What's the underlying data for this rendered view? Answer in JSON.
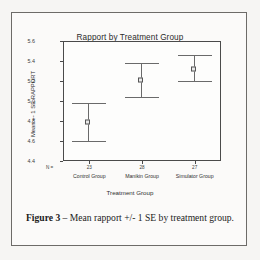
{
  "figure": {
    "caption_label": "Figure 3",
    "caption_dash": " – ",
    "caption_text": "Mean rapport +/- 1 SE by treatment group."
  },
  "chart_data": {
    "type": "scatter",
    "title": "Rapport by Treatment Group",
    "xlabel": "Treatment Group",
    "ylabel": "Mean +- 1 SE RAPPORT",
    "categories": [
      "Control Group",
      "Manikin Group",
      "Simulator Group"
    ],
    "values": [
      4.79,
      5.21,
      5.32
    ],
    "error_upper": [
      4.98,
      5.38,
      5.46
    ],
    "error_lower": [
      4.6,
      5.04,
      5.2
    ],
    "n_caption": "N =",
    "n_values": [
      "23",
      "28",
      "27"
    ],
    "ylim": [
      4.4,
      5.6
    ],
    "yticks": [
      "4.4",
      "4.6",
      "4.8",
      "5.0",
      "5.2",
      "5.4",
      "5.6"
    ],
    "ytick_values": [
      4.4,
      4.6,
      4.8,
      5.0,
      5.2,
      5.4,
      5.6
    ],
    "grid": false,
    "legend": "none",
    "error_type": "1 SE"
  },
  "colors": {
    "axis": "#4a4a4a",
    "marker_edge": "#555555",
    "marker_fill": "#e9e9e9",
    "errorbar": "#6a6a6a",
    "text": "#2f2f2f",
    "page_border": "#6d6b68"
  }
}
